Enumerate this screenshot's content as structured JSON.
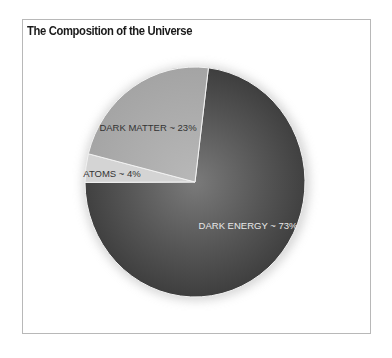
{
  "chart_data": {
    "type": "pie",
    "title": "The Composition of the Universe",
    "categories": [
      "DARK ENERGY",
      "ATOMS",
      "DARK MATTER"
    ],
    "values": [
      73,
      4,
      23
    ],
    "labels": [
      "DARK ENERGY ~ 73%",
      "ATOMS ~ 4%",
      "DARK MATTER ~ 23%"
    ],
    "colors": [
      "#4d4d4d",
      "#d4d4d4",
      "#ababab"
    ],
    "start_angle_deg": 7,
    "direction": "clockwise",
    "legend": "none"
  }
}
